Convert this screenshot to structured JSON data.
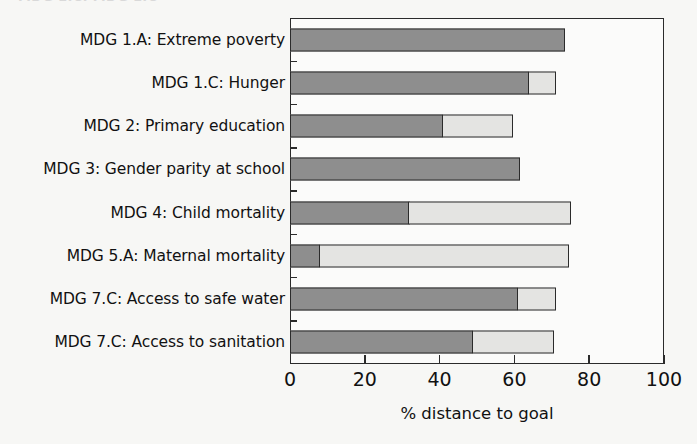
{
  "figure": {
    "clipped_top_text": "MDG 1.C: MDG 1.C",
    "background_color": "#f7f7f5",
    "frame_color": "#2b2b2b"
  },
  "colors": {
    "achieved": "#8e8e8e",
    "remaining": "#e4e4e2",
    "outline": "#2b2b2b"
  },
  "chart_data": {
    "type": "bar",
    "orientation": "horizontal",
    "stacked": true,
    "title": "",
    "xlabel": "% distance to goal",
    "ylabel": "",
    "xlim": [
      0,
      100
    ],
    "xticks": [
      0,
      20,
      40,
      60,
      80,
      100
    ],
    "xticklabels": [
      "0",
      "20",
      "40",
      "60",
      "80",
      "100"
    ],
    "grid": false,
    "legend": null,
    "categories": [
      "MDG 1.A: Extreme poverty",
      "MDG 1.C: Hunger",
      "MDG 2: Primary education",
      "MDG 3: Gender parity at school",
      "MDG 4: Child mortality",
      "MDG 5.A: Maternal mortality",
      "MDG 7.C: Access to safe water",
      "MDG 7.C: Access to sanitation"
    ],
    "series": [
      {
        "name": "dark",
        "color": "#8e8e8e",
        "values": [
          73.5,
          64,
          41,
          61.5,
          32,
          8,
          61,
          49
        ]
      },
      {
        "name": "light",
        "color": "#e4e4e2",
        "values": [
          0,
          7.5,
          19,
          0,
          43.5,
          67,
          10.5,
          22
        ]
      }
    ],
    "totals": [
      73.5,
      71.5,
      60,
      61.5,
      75.5,
      75,
      71.5,
      71
    ]
  }
}
